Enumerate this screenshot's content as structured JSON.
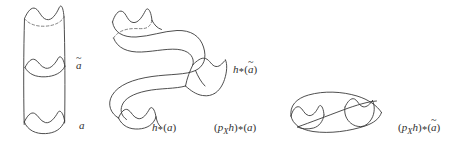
{
  "figure": {
    "background_color": "#ffffff",
    "ink_color": "#3a3a3a",
    "dashed_ink_color": "#6d6d6d",
    "caption_kind": "mathematical-topology-diagram",
    "shapes": [
      {
        "name": "cylinder",
        "description": "vertical cylinder with wavy top rim, a wavy interior cross-section circle, and a wavy bottom rim"
      },
      {
        "name": "s-shaped-tube",
        "description": "S-shaped tube image under h, with wavy open top end, an interior wavy cross-section, and a wavy bottom end"
      },
      {
        "name": "collapsed-tube",
        "description": "flattened horizontal tube image under p_X h, with wavy left end and interior wavy cross-section"
      }
    ],
    "labels": {
      "a_tilde": {
        "base": "a",
        "accent": "~"
      },
      "a": {
        "base": "a"
      },
      "h_star_a_tilde": {
        "fn": "h",
        "star": "*",
        "open": "(",
        "base": "a",
        "accent": "~",
        "close": ")"
      },
      "h_star_a": {
        "fn": "h",
        "star": "*",
        "open": "(",
        "base": "a",
        "close": ")"
      },
      "px_h_star_a": {
        "open1": "(",
        "p": "p",
        "sub": "X",
        "h": "h",
        "close1": ")",
        "star": "*",
        "open2": "(",
        "base": "a",
        "close2": ")"
      },
      "px_h_star_a_tilde": {
        "open1": "(",
        "p": "p",
        "sub": "X",
        "h": "h",
        "close1": ")",
        "star": "*",
        "open2": "(",
        "base": "a",
        "accent": "~",
        "close2": ")"
      }
    }
  }
}
